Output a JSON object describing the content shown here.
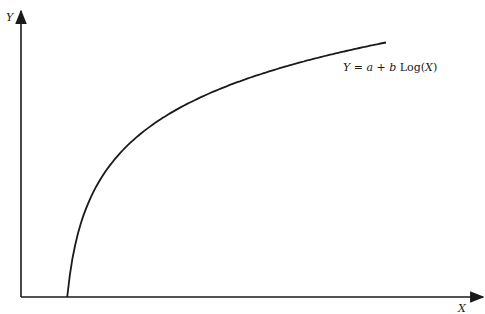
{
  "chart_data": {
    "type": "line",
    "title": "",
    "xlabel": "X",
    "ylabel": "Y",
    "grid": false,
    "ticks": false,
    "annotation": {
      "text_parts": [
        {
          "text": "Y",
          "italic": true
        },
        {
          "text": " = ",
          "italic": false
        },
        {
          "text": "a",
          "italic": true
        },
        {
          "text": " + ",
          "italic": false
        },
        {
          "text": "b",
          "italic": true
        },
        {
          "text": " Log(",
          "italic": false
        },
        {
          "text": "X",
          "italic": true
        },
        {
          "text": ")",
          "italic": false
        }
      ],
      "full_text": "Y = a + b Log(X)",
      "placement": "right-end-of-curve"
    },
    "series": [
      {
        "name": "Y = a + b Log(X)",
        "function": "logarithmic",
        "x_domain": [
          0.02,
          1.0
        ],
        "x_range_fraction": [
          0.1,
          0.79
        ],
        "y_range_fraction": [
          0.0,
          0.89
        ],
        "color": "#1a1a1a"
      }
    ],
    "axis_color": "#1a1a1a"
  }
}
